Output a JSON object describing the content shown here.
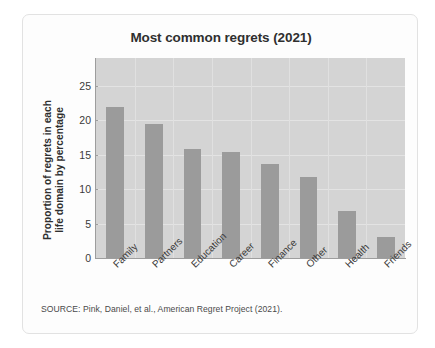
{
  "card": {
    "source_note": "SOURCE: Pink, Daniel, et al., American Regret Project (2021)."
  },
  "chart_data": {
    "type": "bar",
    "title": "Most common regrets (2021)",
    "xlabel": "",
    "ylabel": "Proportion of regrets in each life domain by percentage",
    "ylabel_line1": "Proportion of regrets in each",
    "ylabel_line2": "life domain by percentage",
    "categories": [
      "Family",
      "Partners",
      "Education",
      "Career",
      "Finance",
      "Other",
      "Health",
      "Friends"
    ],
    "values": [
      21.9,
      19.5,
      15.8,
      15.3,
      13.6,
      11.7,
      6.8,
      3.0
    ],
    "ylim": [
      0,
      29
    ],
    "yticks": [
      0,
      5,
      10,
      15,
      20,
      25
    ],
    "ytick_labels": [
      "0",
      "5",
      "10",
      "15",
      "20",
      "25"
    ],
    "grid": true,
    "legend": false,
    "bar_color": "#9b9b9b",
    "plot_background": "#d4d4d4",
    "gridline_color": "#e3e3e3"
  }
}
